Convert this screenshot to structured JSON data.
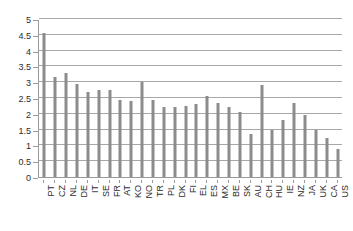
{
  "chart_data": {
    "type": "bar",
    "title": "",
    "subtitle": "",
    "xlabel": "",
    "ylabel": "",
    "ylim": [
      0,
      5
    ],
    "y_ticks": [
      0,
      0.5,
      1,
      1.5,
      2,
      2.5,
      3,
      3.5,
      4,
      4.5,
      5
    ],
    "y_tick_labels": [
      "0",
      "0.5",
      "1",
      "1.5",
      "2",
      "2.5",
      "3",
      "3.5",
      "4",
      "4.5",
      "5"
    ],
    "grid": true,
    "legend": "none",
    "bar_color": "#8c8c8c",
    "axis_color": "#9a9a9a",
    "grid_color": "#a8a8a8",
    "categories": [
      "PT",
      "CZ",
      "NL",
      "DE",
      "IT",
      "SE",
      "FR",
      "AT",
      "KO",
      "NO",
      "TR",
      "PL",
      "DK",
      "FI",
      "EL",
      "ES",
      "MX",
      "BE",
      "SK",
      "AU",
      "CH",
      "HU",
      "IE",
      "NZ",
      "JA",
      "UK",
      "CA",
      "US"
    ],
    "values": [
      4.55,
      3.15,
      3.3,
      2.95,
      2.7,
      2.75,
      2.75,
      2.45,
      2.4,
      3.0,
      2.45,
      2.2,
      2.2,
      2.25,
      2.3,
      2.55,
      2.35,
      2.2,
      2.05,
      1.35,
      2.9,
      1.5,
      1.8,
      2.35,
      1.95,
      1.5,
      1.25,
      0.9
    ]
  }
}
